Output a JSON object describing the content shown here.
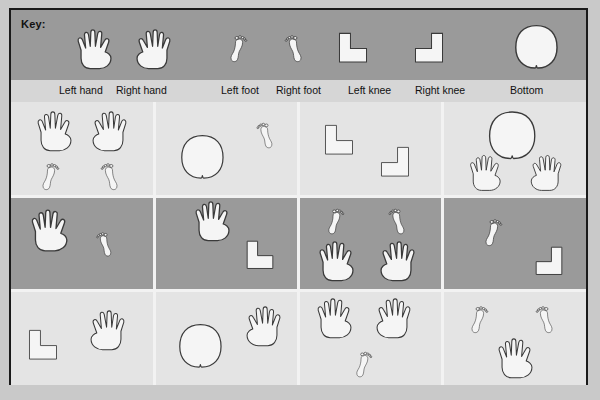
{
  "key": {
    "title": "Key:",
    "items": [
      {
        "label": "Left hand",
        "icon": "left-hand-icon",
        "x": 62,
        "y": 16
      },
      {
        "label": "Right hand",
        "icon": "right-hand-icon",
        "x": 118,
        "y": 16
      },
      {
        "label": "Left foot",
        "icon": "left-foot-icon",
        "x": 216,
        "y": 16
      },
      {
        "label": "Right foot",
        "icon": "right-foot-icon",
        "x": 268,
        "y": 16
      },
      {
        "label": "Left knee",
        "icon": "left-knee-icon",
        "x": 322,
        "y": 20
      },
      {
        "label": "Right knee",
        "icon": "right-knee-icon",
        "x": 398,
        "y": 20
      },
      {
        "label": "Bottom",
        "icon": "bottom-icon",
        "x": 496,
        "y": 12
      }
    ],
    "captions": [
      {
        "text": "Left hand",
        "x": 48
      },
      {
        "text": "Right hand",
        "x": 105
      },
      {
        "text": "Left foot",
        "x": 210
      },
      {
        "text": "Right foot",
        "x": 265
      },
      {
        "text": "Left knee",
        "x": 337
      },
      {
        "text": "Right knee",
        "x": 404
      },
      {
        "text": "Bottom",
        "x": 499
      }
    ]
  },
  "grid": {
    "columns": 4,
    "rows": 3,
    "row_shades": [
      "light",
      "dark",
      "light"
    ],
    "cells": [
      {
        "name": "cell-r1c1",
        "row": 1,
        "col": 1,
        "shade": "light",
        "figures": [
          {
            "icon": "left-hand-icon",
            "x": 22,
            "y": 6,
            "scale": 1.0
          },
          {
            "icon": "right-hand-icon",
            "x": 74,
            "y": 6,
            "scale": 1.0
          },
          {
            "icon": "left-foot-icon",
            "x": 28,
            "y": 52,
            "scale": 1.0
          },
          {
            "icon": "right-foot-icon",
            "x": 84,
            "y": 52,
            "scale": 1.0
          }
        ]
      },
      {
        "name": "cell-r1c2",
        "row": 1,
        "col": 2,
        "shade": "light",
        "figures": [
          {
            "icon": "bottom-icon",
            "x": 18,
            "y": 30,
            "scale": 1.05
          },
          {
            "icon": "right-foot-icon",
            "x": 96,
            "y": 12,
            "scale": 0.95
          }
        ]
      },
      {
        "name": "cell-r1c3",
        "row": 1,
        "col": 3,
        "shade": "light",
        "figures": [
          {
            "icon": "left-knee-icon",
            "x": 20,
            "y": 20,
            "scale": 1.0
          },
          {
            "icon": "right-knee-icon",
            "x": 76,
            "y": 42,
            "scale": 1.0
          }
        ]
      },
      {
        "name": "cell-r1c4",
        "row": 1,
        "col": 4,
        "shade": "light",
        "figures": [
          {
            "icon": "bottom-icon",
            "x": 38,
            "y": 6,
            "scale": 1.15
          },
          {
            "icon": "left-hand-icon",
            "x": 24,
            "y": 50,
            "scale": 0.9
          },
          {
            "icon": "right-hand-icon",
            "x": 82,
            "y": 50,
            "scale": 0.9
          }
        ]
      },
      {
        "name": "cell-r2c1",
        "row": 2,
        "col": 1,
        "shade": "dark",
        "figures": [
          {
            "icon": "left-hand-icon",
            "x": 16,
            "y": 10,
            "scale": 1.05
          },
          {
            "icon": "right-foot-icon",
            "x": 80,
            "y": 28,
            "scale": 0.9
          }
        ]
      },
      {
        "name": "cell-r2c2",
        "row": 2,
        "col": 2,
        "shade": "dark",
        "figures": [
          {
            "icon": "left-hand-icon",
            "x": 36,
            "y": 2,
            "scale": 1.0
          },
          {
            "icon": "left-knee-icon",
            "x": 86,
            "y": 42,
            "scale": 0.95
          }
        ]
      },
      {
        "name": "cell-r2c3",
        "row": 2,
        "col": 3,
        "shade": "dark",
        "figures": [
          {
            "icon": "left-foot-icon",
            "x": 26,
            "y": 4,
            "scale": 0.95
          },
          {
            "icon": "right-foot-icon",
            "x": 84,
            "y": 4,
            "scale": 0.95
          },
          {
            "icon": "left-hand-icon",
            "x": 16,
            "y": 42,
            "scale": 1.0
          },
          {
            "icon": "right-hand-icon",
            "x": 74,
            "y": 42,
            "scale": 1.0
          }
        ]
      },
      {
        "name": "cell-r2c4",
        "row": 2,
        "col": 4,
        "shade": "dark",
        "figures": [
          {
            "icon": "left-foot-icon",
            "x": 40,
            "y": 14,
            "scale": 1.0
          },
          {
            "icon": "right-knee-icon",
            "x": 88,
            "y": 48,
            "scale": 0.95
          }
        ]
      },
      {
        "name": "cell-r3c1",
        "row": 3,
        "col": 1,
        "shade": "light",
        "figures": [
          {
            "icon": "left-knee-icon",
            "x": 12,
            "y": 36,
            "scale": 1.0
          },
          {
            "icon": "right-hand-icon",
            "x": 72,
            "y": 16,
            "scale": 1.0
          }
        ]
      },
      {
        "name": "cell-r3c2",
        "row": 3,
        "col": 2,
        "shade": "light",
        "figures": [
          {
            "icon": "bottom-icon",
            "x": 16,
            "y": 30,
            "scale": 1.05
          },
          {
            "icon": "right-hand-icon",
            "x": 84,
            "y": 12,
            "scale": 1.0
          }
        ]
      },
      {
        "name": "cell-r3c3",
        "row": 3,
        "col": 3,
        "shade": "light",
        "figures": [
          {
            "icon": "left-hand-icon",
            "x": 14,
            "y": 4,
            "scale": 1.0
          },
          {
            "icon": "right-hand-icon",
            "x": 70,
            "y": 4,
            "scale": 1.0
          },
          {
            "icon": "left-foot-icon",
            "x": 54,
            "y": 52,
            "scale": 0.95
          }
        ]
      },
      {
        "name": "cell-r3c4",
        "row": 3,
        "col": 4,
        "shade": "light",
        "figures": [
          {
            "icon": "left-foot-icon",
            "x": 26,
            "y": 6,
            "scale": 1.0
          },
          {
            "icon": "right-foot-icon",
            "x": 88,
            "y": 6,
            "scale": 1.0
          },
          {
            "icon": "left-hand-icon",
            "x": 52,
            "y": 44,
            "scale": 1.0
          }
        ]
      }
    ]
  },
  "colors": {
    "page_background": "#c9c9c9",
    "frame_border": "#1a1a1a",
    "key_band": "#9a9a9a",
    "caption_band": "#d6d6d6",
    "cell_light": "#e4e4e4",
    "cell_dark": "#9a9a9a",
    "separator": "#f2f2f2",
    "icon_fill_light": "#f5f5f5",
    "icon_outline": "#3a3a3a",
    "text": "#111111"
  }
}
